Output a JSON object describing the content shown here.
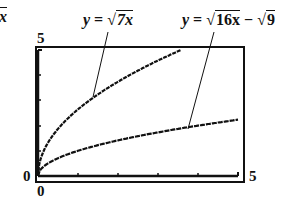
{
  "chart_data": {
    "type": "line",
    "title": "",
    "xlabel": "",
    "ylabel": "",
    "xlim": [
      0,
      5
    ],
    "ylim": [
      0,
      5
    ],
    "grid": false,
    "tick_labels": {
      "x_min": "0",
      "x_max": "5",
      "y_min": "0",
      "y_max": "5"
    },
    "x_ticks": [
      0,
      1,
      2,
      3,
      4,
      5
    ],
    "y_ticks": [
      0,
      1,
      2,
      3,
      4,
      5
    ],
    "series": [
      {
        "name": "y = √7x",
        "x": [
          0,
          0.25,
          0.5,
          1,
          1.5,
          2,
          2.5,
          3,
          3.57
        ],
        "y": [
          0,
          1.32,
          1.87,
          2.65,
          3.24,
          3.74,
          4.18,
          4.58,
          5.0
        ]
      },
      {
        "name": "y = √16x − √9x",
        "x": [
          0,
          0.25,
          0.5,
          1,
          2,
          3,
          4,
          5
        ],
        "y": [
          0,
          0.5,
          0.71,
          1.0,
          1.41,
          1.73,
          2.0,
          2.24
        ]
      }
    ],
    "annotations": [
      "y = √7x",
      "y = √16x − √9",
      "√x"
    ]
  },
  "labels": {
    "top_left_fragment": "x",
    "eq1_prefix": "y = ",
    "eq1_radicand": "7x",
    "eq2_prefix": "y = ",
    "eq2_radicand1": "16x",
    "eq2_minus": " − ",
    "eq2_radicand2": "9",
    "y_max": "5",
    "y_min": "0",
    "x_min": "0",
    "x_max": "5"
  }
}
